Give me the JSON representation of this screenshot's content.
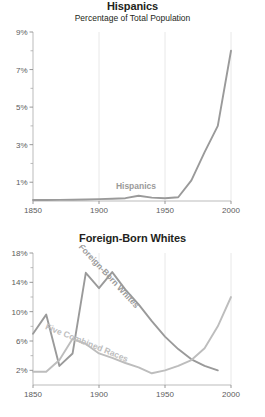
{
  "figure": {
    "background_color": "#ffffff",
    "width": 265,
    "height": 417
  },
  "charts": [
    {
      "id": "hispanics",
      "title": "Hispanics",
      "subtitle": "Percentage of Total Population"
    },
    {
      "id": "foreign-born-whites",
      "title": "Foreign-Born Whites",
      "subtitle": ""
    }
  ],
  "chart_data": [
    {
      "type": "line",
      "id": "hispanics",
      "title": "Hispanics",
      "subtitle": "Percentage of Total Population",
      "xlabel": "",
      "ylabel": "",
      "xlim": [
        1850,
        2000
      ],
      "ylim": [
        0,
        9
      ],
      "xticks": [
        1850,
        1900,
        1950,
        2000
      ],
      "xtick_labels": [
        "1850",
        "1900",
        "1950",
        "2000"
      ],
      "yticks": [
        1,
        3,
        5,
        7,
        9
      ],
      "ytick_labels": [
        "1%",
        "3%",
        "5%",
        "7%",
        "9%"
      ],
      "yticks_minor": [
        2,
        4,
        6,
        8
      ],
      "grid": "vertical-only",
      "legend": "inline-series-label",
      "series": [
        {
          "name": "Hispanics",
          "color": "#9a9a9a",
          "label_x": 1928,
          "label_y": 0.62,
          "x": [
            1850,
            1860,
            1870,
            1880,
            1890,
            1900,
            1910,
            1920,
            1930,
            1940,
            1950,
            1960,
            1970,
            1980,
            1990,
            2000
          ],
          "values": [
            0.05,
            0.05,
            0.06,
            0.07,
            0.08,
            0.1,
            0.12,
            0.15,
            0.28,
            0.18,
            0.15,
            0.2,
            1.1,
            2.6,
            4.0,
            8.0
          ]
        }
      ]
    },
    {
      "type": "line",
      "id": "foreign-born-whites",
      "title": "Foreign-Born Whites",
      "subtitle": "",
      "xlabel": "",
      "ylabel": "",
      "xlim": [
        1850,
        2000
      ],
      "ylim": [
        0,
        18
      ],
      "xticks": [
        1850,
        1900,
        1950,
        2000
      ],
      "xtick_labels": [
        "1850",
        "1900",
        "1950",
        "2000"
      ],
      "yticks": [
        2,
        6,
        10,
        14,
        18
      ],
      "ytick_labels": [
        "2%",
        "6%",
        "10%",
        "14%",
        "18%"
      ],
      "yticks_minor": [
        4,
        8,
        12,
        16
      ],
      "grid": "vertical-only",
      "legend": "inline-series-labels",
      "series": [
        {
          "name": "Foreign-Born Whites",
          "color": "#9a9a9a",
          "label_rotation": 47,
          "label_x": 1906,
          "label_y": 14.6,
          "x": [
            1850,
            1860,
            1870,
            1880,
            1890,
            1900,
            1910,
            1920,
            1930,
            1940,
            1950,
            1960,
            1970,
            1980,
            1990
          ],
          "values": [
            7.0,
            9.6,
            2.6,
            4.3,
            15.3,
            13.2,
            15.4,
            13.0,
            11.0,
            8.7,
            6.6,
            4.9,
            3.5,
            2.6,
            2.0
          ]
        },
        {
          "name": "Five Combined Races",
          "color": "#bdbdbd",
          "label_rotation": 22,
          "label_x": 1890,
          "label_y": 5.4,
          "x": [
            1850,
            1860,
            1870,
            1880,
            1890,
            1900,
            1910,
            1920,
            1930,
            1940,
            1950,
            1960,
            1970,
            1980,
            1990,
            2000
          ],
          "values": [
            1.8,
            1.8,
            3.4,
            6.3,
            5.6,
            4.3,
            3.7,
            3.0,
            2.4,
            1.6,
            2.0,
            2.6,
            3.4,
            5.0,
            8.0,
            12.0
          ]
        }
      ]
    }
  ]
}
